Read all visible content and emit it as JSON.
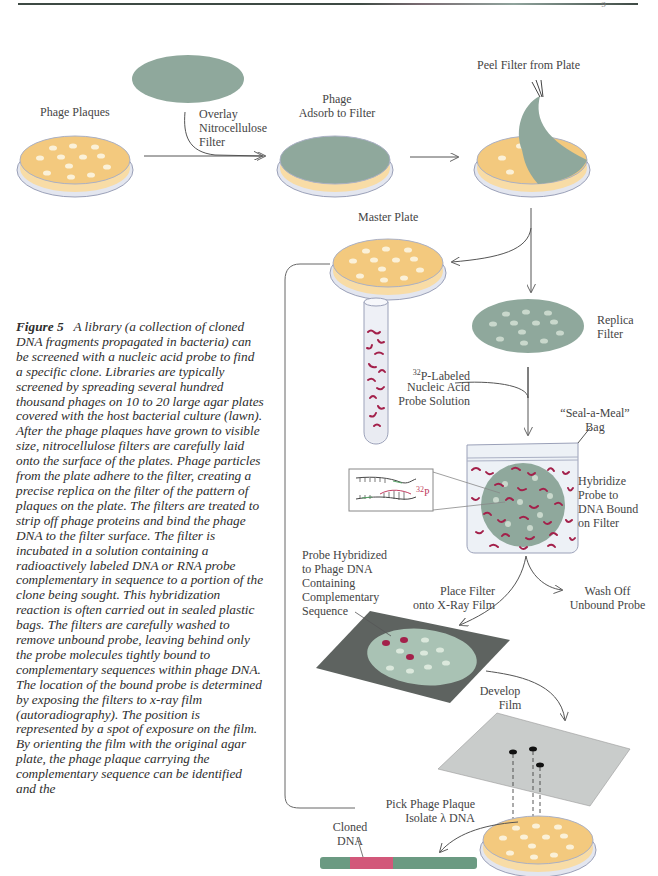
{
  "header": {
    "page_mark": "9"
  },
  "labels": {
    "phage_plaques": "Phage Plaques",
    "overlay_filter": [
      "Overlay",
      "Nitrocellulose",
      "Filter"
    ],
    "phage_adsorb": [
      "Phage",
      "Adsorb to Filter"
    ],
    "peel_filter": "Peel Filter from Plate",
    "master_plate": "Master Plate",
    "replica_filter": [
      "Replica",
      "Filter"
    ],
    "probe_solution": [
      "P-Labeled",
      "Nucleic Acid",
      "Probe Solution"
    ],
    "probe_isotope": "32",
    "seal_bag": [
      "“Seal-a-Meal”",
      "Bag"
    ],
    "hybridize": [
      "Hybridize",
      "Probe to",
      "DNA Bound",
      "on Filter"
    ],
    "inset_isotope": "32",
    "inset_p": "P",
    "probe_hybridized": [
      "Probe Hybridized",
      "to Phage DNA",
      "Containing",
      "Complementary",
      "Sequence"
    ],
    "place_filter": [
      "Place Filter",
      "onto X-Ray Film"
    ],
    "wash_off": [
      "Wash Off",
      "Unbound Probe"
    ],
    "develop_film": [
      "Develop",
      "Film"
    ],
    "pick_plaque": [
      "Pick Phage Plaque",
      "Isolate λ DNA"
    ],
    "cloned_dna": [
      "Cloned",
      "DNA"
    ]
  },
  "caption": {
    "figure_label": "Figure 5",
    "text": "A library (a collection of cloned DNA fragments propagated in bacteria) can be screened with a nucleic acid probe to find a specific clone. Libraries are typically screened by spreading several hundred thousand phages on 10 to 20 large agar plates covered with the host bacterial culture (lawn). After the phage plaques have grown to visible size, nitrocellulose filters are carefully laid onto the surface of the plates. Phage particles from the plate adhere to the filter, creating a precise replica on the filter of the pattern of plaques on the plate. The filters are treated to strip off phage proteins and bind the phage DNA to the filter surface. The filter is incubated in a solution containing a radioactively labeled DNA or RNA probe complementary in sequence to a portion of the clone being sought. This hybridization reaction is often carried out in sealed plastic bags. The filters are carefully washed to remove unbound probe, leaving behind only the probe molecules tightly bound to complementary sequences within phage DNA. The location of the bound probe is determined by exposing the filters to x-ray film (autoradiography). The position is represented by a spot of exposure on the film. By orienting the film with the original agar plate, the phage plaque carrying the complementary sequence can be identified and the"
  },
  "colors": {
    "agar": "#f3c97e",
    "agar_light": "#f8dca6",
    "filter": "#8fa89c",
    "plaque": "#fbf1d8",
    "probe": "#a3204a",
    "film_dark": "#5e6360",
    "film_light": "#c9cccb",
    "dna_green": "#6b9a82",
    "dna_pink": "#d2587a"
  }
}
